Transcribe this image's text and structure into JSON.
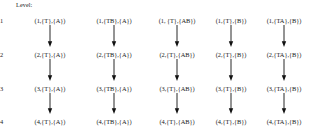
{
  "figure": {
    "caption": "Level:",
    "levels": [
      {
        "label": "1"
      },
      {
        "label": "2"
      },
      {
        "label": "3"
      },
      {
        "label": "4"
      }
    ],
    "columns": [
      {
        "nodes": [
          "(1,{T},{A})",
          "(2,{T},{A})",
          "(3,{T},{A})",
          "(4,{T},{A})"
        ]
      },
      {
        "nodes": [
          "(1,{TB},{A})",
          "(2,{TB},{A})",
          "(3,{TB},{A})",
          "(4,{TB},{A})"
        ]
      },
      {
        "nodes": [
          "(1, {T},{AB})",
          "(2,{T},{AB})",
          "(3,{T},{AB})",
          "(4,{T},{AB})"
        ]
      },
      {
        "nodes": [
          "(1,{T},{B})",
          "(2,{T},{B})",
          "(3,{T},{B})",
          "(4,{T},{B})"
        ]
      },
      {
        "nodes": [
          "(1,{TA},{B})",
          "(2,{TA},{B})",
          "(3,{TA},{B})",
          "(4,{TA},{B})"
        ]
      }
    ],
    "colors": {
      "background": "#ffffff",
      "text": "#1a1a1a",
      "arrow": "#111111"
    }
  }
}
